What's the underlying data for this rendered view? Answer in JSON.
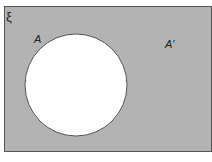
{
  "diagram": {
    "type": "venn",
    "universal_set_label": "ξ",
    "sets": [
      {
        "name": "A",
        "label": "A",
        "shaded": false
      }
    ],
    "complement_label": "A'",
    "shaded_region": "A'",
    "colors": {
      "shaded_fill": "#b3b3b3",
      "set_fill": "#ffffff",
      "outline": "#555555"
    }
  }
}
